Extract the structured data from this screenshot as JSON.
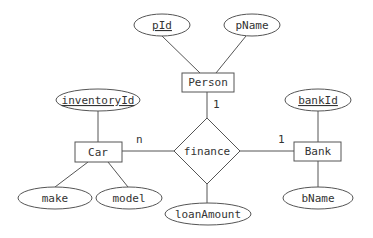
{
  "diagram": {
    "type": "ER diagram",
    "relationship": {
      "name": "finance",
      "attributes": [
        "loanAmount"
      ]
    },
    "entities": [
      {
        "name": "Person",
        "attributes": [
          {
            "name": "pId",
            "key": true
          },
          {
            "name": "pName",
            "key": false
          }
        ]
      },
      {
        "name": "Car",
        "attributes": [
          {
            "name": "inventoryId",
            "key": true
          },
          {
            "name": "make",
            "key": false
          },
          {
            "name": "model",
            "key": false
          }
        ]
      },
      {
        "name": "Bank",
        "attributes": [
          {
            "name": "bankId",
            "key": true
          },
          {
            "name": "bName",
            "key": false
          }
        ]
      }
    ],
    "cardinalities": {
      "person": "1",
      "car": "n",
      "bank": "1"
    },
    "labels": {
      "person": "Person",
      "car": "Car",
      "bank": "Bank",
      "finance": "finance",
      "pId": "pId",
      "pName": "pName",
      "inventoryId": "inventoryId",
      "make": "make",
      "model": "model",
      "bankId": "bankId",
      "bName": "bName",
      "loanAmount": "loanAmount"
    },
    "colors": {
      "stroke": "#555555",
      "text": "#333333",
      "background": "#ffffff"
    }
  }
}
